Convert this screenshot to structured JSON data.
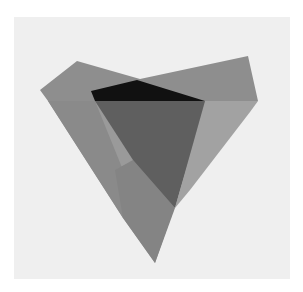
{
  "image": {
    "description": "Photograph of an abstract artwork: overlapping translucent gray paper pieces forming an inverted triangle / heart-like shape on a light panel",
    "width": 303,
    "height": 292
  },
  "colors": {
    "page_background": "#ffffff",
    "panel": "#efefef",
    "outer_paper_top": "#8e8e8e",
    "outer_paper_lower": "#9a9a9a",
    "right_flap": "#a2a2a2",
    "left_fold": "#8a8a8a",
    "lower_overlap": "#848484",
    "inner_quad": "#5f5f5f",
    "top_black": "#111111"
  },
  "shapes": {
    "panel": {
      "x": 14,
      "y": 17,
      "width": 276,
      "height": 262
    },
    "outer_paper_top": "77,61 40,90 48,101 258,101 248,56 140,79",
    "outer_paper_lower": "48,101 123,218 155,263 174,208 207,104 258,101",
    "right_flap": "205,101 258,101 250,112 190,190 175,208",
    "left_fold": "48,101 95,101 125,175 123,218",
    "lower_overlap": "115,170 133,160 175,208 155,263 123,218",
    "inner_quad": "95,101 205,101 175,208 133,160",
    "top_black": "91,91 137,80 205,101 95,101"
  }
}
